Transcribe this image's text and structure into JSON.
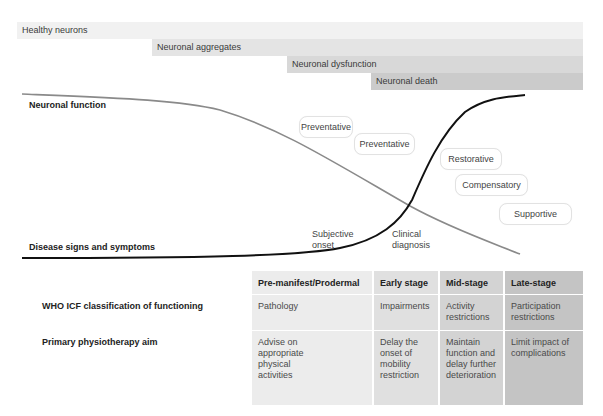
{
  "stage_bars": [
    {
      "label": "Healthy neurons",
      "color": "#f1f1f1"
    },
    {
      "label": "Neuronal aggregates",
      "color": "#e4e4e4"
    },
    {
      "label": "Neuronal dysfunction",
      "color": "#d8d8d8"
    },
    {
      "label": "Neuronal death",
      "color": "#cbcbcb"
    }
  ],
  "curves": {
    "neuronal_function_label": "Neuronal function",
    "disease_signs_label": "Disease signs and symptoms",
    "neuronal_function_color": "#8a8a8a",
    "disease_signs_color": "#111111"
  },
  "milestones": {
    "subjective_onset": "Subjective onset",
    "subjective_onset_line1": "Subjective",
    "subjective_onset_line2": "onset",
    "clinical_diagnosis_line1": "Clinical",
    "clinical_diagnosis_line2": "diagnosis"
  },
  "intervention_types": [
    {
      "label": "Preventative"
    },
    {
      "label": "Preventative"
    },
    {
      "label": "Restorative"
    },
    {
      "label": "Compensatory"
    },
    {
      "label": "Supportive"
    }
  ],
  "table": {
    "columns": [
      {
        "label": "Pre-manifest/Prodermal",
        "color": "#ececec"
      },
      {
        "label": "Early stage",
        "color": "#e0e0e0"
      },
      {
        "label": "Mid-stage",
        "color": "#d3d3d3"
      },
      {
        "label": "Late-stage",
        "color": "#c4c4c4"
      }
    ],
    "rows": [
      {
        "label": "WHO ICF classification of functioning",
        "cells": [
          "Pathology",
          "Impairments",
          "Activity restrictions",
          "Participation restrictions"
        ]
      },
      {
        "label": "Primary physiotherapy aim",
        "cells": [
          "Advise on appropriate physical activities",
          "Delay the onset of mobility restriction",
          "Maintain function and delay further deterioration",
          "Limit impact of complications"
        ]
      }
    ]
  }
}
